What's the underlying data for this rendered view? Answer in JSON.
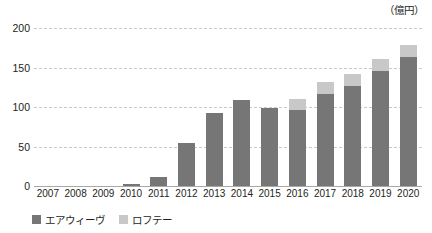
{
  "unit_label": "（億円）",
  "legend": {
    "items": [
      {
        "label": "エアウィーヴ",
        "color": "#767676"
      },
      {
        "label": "ロフテー",
        "color": "#c8c8c8"
      }
    ]
  },
  "axis": {
    "y_ticks": [
      "0",
      "50",
      "100",
      "150",
      "200"
    ],
    "x_labels": [
      "2007",
      "2008",
      "2009",
      "2010",
      "2011",
      "2012",
      "2013",
      "2014",
      "2015",
      "2016",
      "2017",
      "2018",
      "2019",
      "2020"
    ]
  },
  "chart_data": {
    "type": "bar",
    "stacked": true,
    "title": "",
    "subtitle": "",
    "xlabel": "",
    "ylabel": "",
    "unit": "億円",
    "ylim": [
      0,
      200
    ],
    "yticks": [
      0,
      50,
      100,
      150,
      200
    ],
    "grid": true,
    "legend_position": "bottom-left",
    "categories": [
      "2007",
      "2008",
      "2009",
      "2010",
      "2011",
      "2012",
      "2013",
      "2014",
      "2015",
      "2016",
      "2017",
      "2018",
      "2019",
      "2020"
    ],
    "series": [
      {
        "name": "エアウィーヴ",
        "color": "#767676",
        "values": [
          0,
          0,
          0,
          3,
          12,
          54,
          93,
          109,
          99,
          96,
          117,
          127,
          146,
          163
        ]
      },
      {
        "name": "ロフテー",
        "color": "#c8c8c8",
        "values": [
          0,
          0,
          0,
          0,
          0,
          0,
          0,
          0,
          0,
          14,
          15,
          15,
          15,
          15
        ]
      }
    ],
    "totals": [
      0,
      0,
      0,
      3,
      12,
      54,
      93,
      109,
      99,
      110,
      132,
      142,
      161,
      178
    ]
  }
}
